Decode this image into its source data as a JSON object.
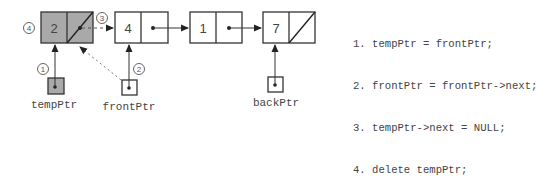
{
  "diagram": {
    "colors": {
      "stroke": "#333333",
      "highlight_fill": "#a9a9a9",
      "node_fill": "#ffffff",
      "text": "#444444"
    },
    "nodes": [
      {
        "value": "2",
        "next": "null (deleted link)",
        "highlighted": true
      },
      {
        "value": "4",
        "next": "pointer"
      },
      {
        "value": "1",
        "next": "pointer"
      },
      {
        "value": "7",
        "next": "null"
      }
    ],
    "pointers": [
      {
        "label": "tempPtr",
        "target_node": 0,
        "highlighted": true,
        "step": "1"
      },
      {
        "label": "frontPtr",
        "target_node": 1,
        "step": "2",
        "old_target_node": 0
      },
      {
        "label": "backPtr",
        "target_node": 3
      }
    ],
    "step_markers": [
      "1",
      "2",
      "3",
      "4"
    ],
    "code_steps": [
      {
        "num": "1.",
        "text": "tempPtr = frontPtr;"
      },
      {
        "num": "2.",
        "text": "frontPtr = frontPtr->next;"
      },
      {
        "num": "3.",
        "text": "tempPtr->next = NULL;"
      },
      {
        "num": "4.",
        "text": "delete tempPtr;"
      }
    ]
  }
}
